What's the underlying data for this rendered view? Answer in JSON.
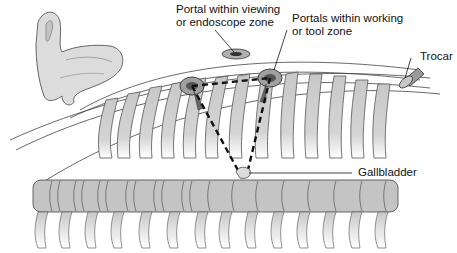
{
  "figure": {
    "labels": {
      "viewing_portal_line1": "Portal within viewing",
      "viewing_portal_line2": "or endoscope zone",
      "working_portal_line1": "Portals within working",
      "working_portal_line2": "or tool zone",
      "trocar": "Trocar",
      "gallbladder": "Gallbladder"
    },
    "colors": {
      "bone_fill": "#c8c8c8",
      "bone_stroke": "#444444",
      "line": "#111111",
      "portal_fill": "#a0a0a0",
      "background": "#ffffff"
    }
  }
}
